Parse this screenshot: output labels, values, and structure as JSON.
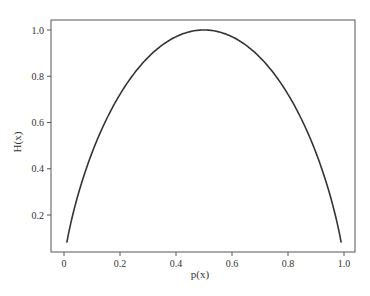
{
  "chart_data": {
    "type": "line",
    "title": "",
    "xlabel": "p(x)",
    "ylabel": "H(x)",
    "xlim": [
      -0.05,
      1.03
    ],
    "ylim": [
      0.0,
      1.05
    ],
    "grid": false,
    "legend": null,
    "xticks": [
      0,
      0.2,
      0.4,
      0.6,
      0.8,
      1.0
    ],
    "xtick_labels": [
      "0",
      "0.2",
      "0.4",
      "0.6",
      "0.8",
      "1.0"
    ],
    "yticks": [
      0.2,
      0.4,
      0.6,
      0.8,
      1.0
    ],
    "ytick_labels": [
      "0.2",
      "0.4",
      "0.6",
      "0.8",
      "1.0"
    ],
    "series": [
      {
        "name": "binary entropy H(p) = -p log2 p - (1-p) log2 (1-p)",
        "color": "#333333",
        "x": [
          0.01,
          0.05,
          0.1,
          0.15,
          0.2,
          0.25,
          0.3,
          0.35,
          0.4,
          0.45,
          0.5,
          0.55,
          0.6,
          0.65,
          0.7,
          0.75,
          0.8,
          0.85,
          0.9,
          0.95,
          0.99
        ],
        "y": [
          0.081,
          0.286,
          0.469,
          0.61,
          0.722,
          0.811,
          0.881,
          0.934,
          0.971,
          0.993,
          1.0,
          0.993,
          0.971,
          0.934,
          0.881,
          0.811,
          0.722,
          0.61,
          0.469,
          0.286,
          0.081
        ]
      }
    ]
  },
  "colors": {
    "line": "#333333",
    "axis": "#555555",
    "background": "#ffffff"
  }
}
